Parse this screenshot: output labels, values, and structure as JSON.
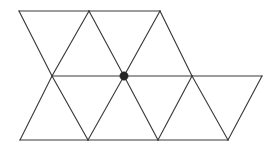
{
  "figure": {
    "type": "geometric-diagram",
    "canvas": {
      "width": 266,
      "height": 152,
      "background": "#ffffff"
    },
    "style": {
      "edge_color": "#3a3a3a",
      "edge_width": 1.15,
      "vertex_marker_color": "#262626",
      "vertex_marker_radius": 4.2
    },
    "rows": [
      {
        "name": "top-row",
        "y": 11,
        "x_positions": [
          19,
          89,
          160
        ]
      },
      {
        "name": "middle-row",
        "y": 76,
        "x_positions": [
          52,
          124,
          192,
          262
        ]
      },
      {
        "name": "bottom-row",
        "y": 140,
        "x_positions": [
          20,
          88,
          158,
          228
        ]
      }
    ],
    "vertices": [
      {
        "id": "t0",
        "x": 19,
        "y": 11,
        "marked": false
      },
      {
        "id": "t1",
        "x": 89,
        "y": 11,
        "marked": false
      },
      {
        "id": "t2",
        "x": 160,
        "y": 11,
        "marked": false
      },
      {
        "id": "m0",
        "x": 52,
        "y": 76,
        "marked": false
      },
      {
        "id": "m1",
        "x": 124,
        "y": 76,
        "marked": true
      },
      {
        "id": "m2",
        "x": 192,
        "y": 76,
        "marked": false
      },
      {
        "id": "m3",
        "x": 262,
        "y": 76,
        "marked": false
      },
      {
        "id": "b0",
        "x": 20,
        "y": 140,
        "marked": false
      },
      {
        "id": "b1",
        "x": 88,
        "y": 140,
        "marked": false
      },
      {
        "id": "b2",
        "x": 158,
        "y": 140,
        "marked": false
      },
      {
        "id": "b3",
        "x": 228,
        "y": 140,
        "marked": false
      }
    ],
    "edges": [
      {
        "from": "t0",
        "to": "t1",
        "kind": "horizontal-top"
      },
      {
        "from": "t1",
        "to": "t2",
        "kind": "horizontal-top"
      },
      {
        "from": "m0",
        "to": "m1",
        "kind": "horizontal-middle"
      },
      {
        "from": "m1",
        "to": "m2",
        "kind": "horizontal-middle"
      },
      {
        "from": "m2",
        "to": "m3",
        "kind": "horizontal-middle"
      },
      {
        "from": "b0",
        "to": "b1",
        "kind": "horizontal-bottom"
      },
      {
        "from": "b1",
        "to": "b2",
        "kind": "horizontal-bottom"
      },
      {
        "from": "b2",
        "to": "b3",
        "kind": "horizontal-bottom"
      },
      {
        "from": "t0",
        "to": "m0",
        "kind": "diagonal-down-right"
      },
      {
        "from": "t1",
        "to": "m1",
        "kind": "diagonal-down-right"
      },
      {
        "from": "t2",
        "to": "m2",
        "kind": "diagonal-down-right"
      },
      {
        "from": "t1",
        "to": "m0",
        "kind": "diagonal-down-left"
      },
      {
        "from": "t2",
        "to": "m1",
        "kind": "diagonal-down-left"
      },
      {
        "from": "m0",
        "to": "b1",
        "kind": "diagonal-down-right"
      },
      {
        "from": "m1",
        "to": "b2",
        "kind": "diagonal-down-right"
      },
      {
        "from": "m2",
        "to": "b3",
        "kind": "diagonal-down-right"
      },
      {
        "from": "m0",
        "to": "b0",
        "kind": "diagonal-down-left"
      },
      {
        "from": "m1",
        "to": "b1",
        "kind": "diagonal-down-left"
      },
      {
        "from": "m2",
        "to": "b2",
        "kind": "diagonal-down-left"
      },
      {
        "from": "m3",
        "to": "b3",
        "kind": "diagonal-down-left"
      }
    ],
    "marked_vertex": {
      "id": "m1",
      "x": 124,
      "y": 76,
      "radius": 4.2
    }
  }
}
